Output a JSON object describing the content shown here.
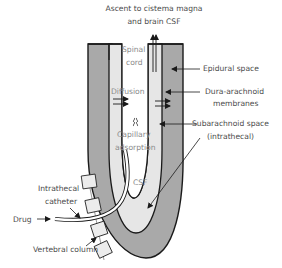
{
  "diagram": {
    "title_line1": "Ascent to cistema magna",
    "title_line2": "and brain CSF",
    "labels": {
      "spinal_cord_1": "Spinal",
      "spinal_cord_2": "cord",
      "epidural_space": "Epidural space",
      "dura_1": "Dura-arachnoid",
      "dura_2": "membranes",
      "diffusion": "Diffusion",
      "subarachnoid_1": "Subarachnoid space",
      "subarachnoid_2": "(intrathecal)",
      "capillary_1": "Capillary",
      "capillary_2": "adsorption",
      "csf": "CSF",
      "catheter_1": "Intrathecal",
      "catheter_2": "catheter",
      "drug": "Drug",
      "vertebral_column": "Vertebral column"
    },
    "colors": {
      "epidural_fill": "#a9a9a9",
      "csf_fill": "#e6e6e6",
      "cord_fill": "#ffffff",
      "outline": "#1a1a1a",
      "text": "#4a4a4a",
      "inner_text": "#8a8a8a"
    }
  }
}
